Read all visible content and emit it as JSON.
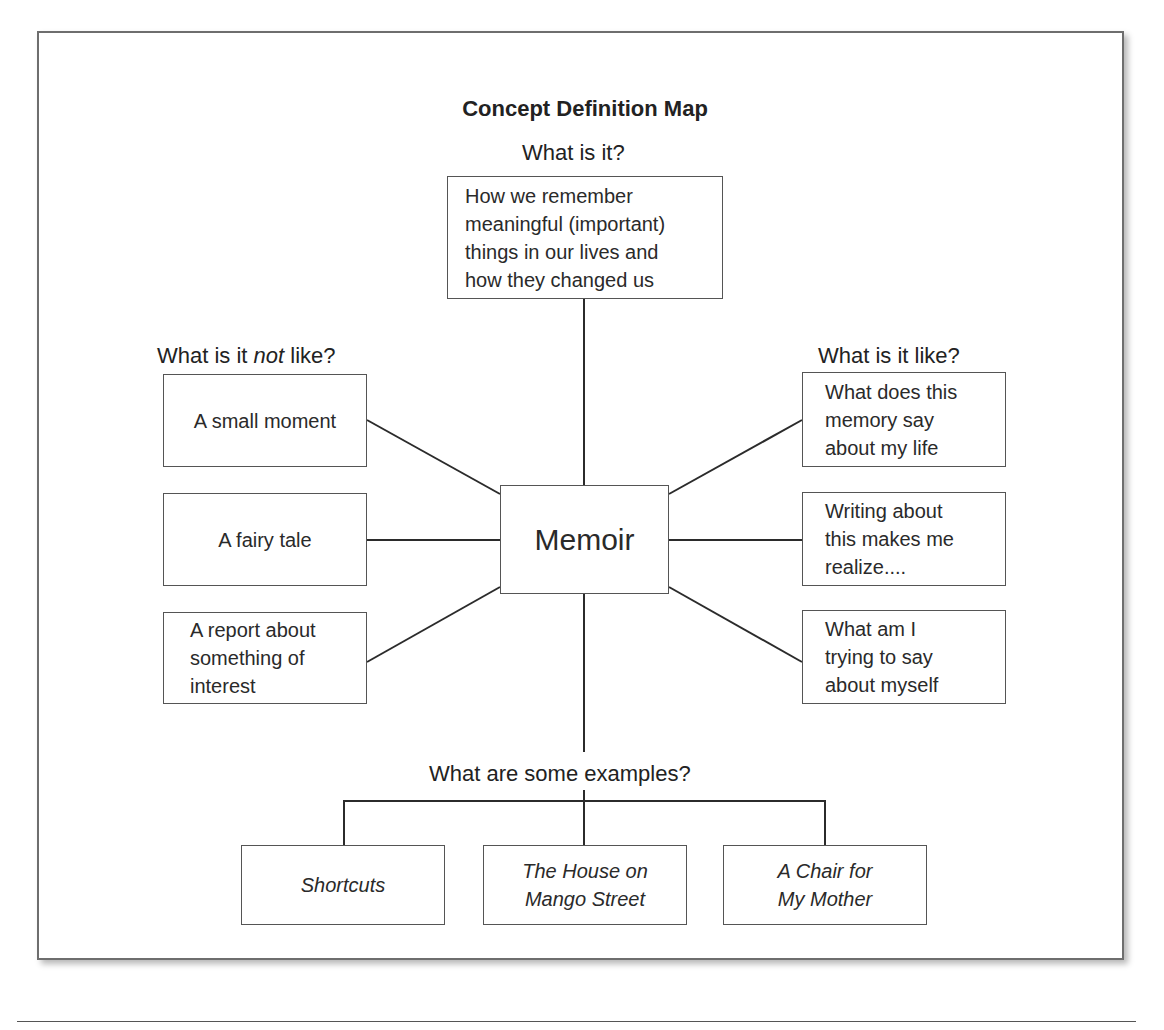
{
  "title": "Concept Definition Map",
  "sections": {
    "what_is_it": {
      "heading": "What is it?",
      "text": "How we remember\nmeaningful (important)\nthings in our lives and\nhow they changed us"
    },
    "not_like": {
      "heading_pre": "What is it ",
      "heading_em": "not",
      "heading_post": " like?",
      "items": [
        {
          "text": "A small moment"
        },
        {
          "text": "A fairy tale"
        },
        {
          "text": "A report about\nsomething of\ninterest"
        }
      ]
    },
    "is_like": {
      "heading": "What is it like?",
      "items": [
        {
          "text": "What does this\nmemory say\nabout my life"
        },
        {
          "text": "Writing about\nthis makes me\nrealize...."
        },
        {
          "text": "What am I\ntrying to say\nabout myself"
        }
      ]
    },
    "concept": {
      "text": "Memoir"
    },
    "examples": {
      "heading": "What are some examples?",
      "items": [
        {
          "text": "Shortcuts"
        },
        {
          "text": "The House on\nMango Street"
        },
        {
          "text": "A Chair for\nMy Mother"
        }
      ]
    }
  },
  "colors": {
    "line": "#2b2b2b",
    "border": "#555555",
    "frame": "#6e6e6e"
  }
}
